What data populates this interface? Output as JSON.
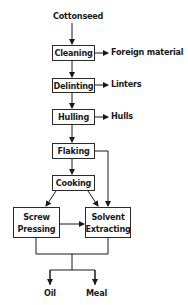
{
  "diagram": {
    "input": "Cottonseed",
    "steps": [
      {
        "label": "Cleaning",
        "byproduct": "Foreign material"
      },
      {
        "label": "Delinting",
        "byproduct": "Linters"
      },
      {
        "label": "Hulling",
        "byproduct": "Hulls"
      },
      {
        "label": "Flaking"
      },
      {
        "label": "Cooking"
      }
    ],
    "screw_pressing": {
      "line1": "Screw",
      "line2": "Pressing"
    },
    "solvent_extracting": {
      "line1": "Solvent",
      "line2": "Extracting"
    },
    "outputs": [
      "Oil",
      "Meal"
    ]
  }
}
